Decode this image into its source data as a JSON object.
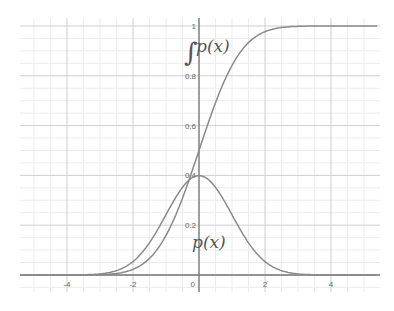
{
  "chart_data": {
    "type": "line",
    "title": "",
    "xlabel": "",
    "ylabel": "",
    "xlim": [
      -5.4,
      5.4
    ],
    "ylim": [
      -0.05,
      1.03
    ],
    "grid": true,
    "x_ticks": [
      "-4",
      "-2",
      "0",
      "2",
      "4"
    ],
    "y_ticks": [
      "0.2",
      "0.4",
      "0.6",
      "0.8",
      "1"
    ],
    "origin_label": "0",
    "annotations": [
      {
        "text": "∫p(x)",
        "x": -0.2,
        "y": 0.9
      },
      {
        "text": "p(x)",
        "x": -0.2,
        "y": 0.12
      }
    ],
    "series": [
      {
        "name": "p(x)",
        "description": "standard normal probability density",
        "x": [
          -4,
          -3,
          -2,
          -1.5,
          -1,
          -0.5,
          0,
          0.5,
          1,
          1.5,
          2,
          3,
          4
        ],
        "values": [
          0.0001,
          0.0044,
          0.054,
          0.1295,
          0.242,
          0.352,
          0.399,
          0.352,
          0.242,
          0.1295,
          0.054,
          0.0044,
          0.0001
        ]
      },
      {
        "name": "∫p(x)",
        "description": "standard normal cumulative distribution",
        "x": [
          -4,
          -3,
          -2,
          -1.5,
          -1,
          -0.5,
          0,
          0.5,
          1,
          1.5,
          2,
          3,
          4
        ],
        "values": [
          3e-05,
          0.0013,
          0.0228,
          0.0668,
          0.1587,
          0.3085,
          0.5,
          0.6915,
          0.8413,
          0.9332,
          0.9772,
          0.9987,
          0.99997
        ]
      }
    ]
  },
  "labels": {
    "cdf": "∫p(x)",
    "pdf": "p(x)"
  },
  "colors": {
    "curve": "#8a8a8a",
    "axis": "#777777",
    "grid_major": "#cfcfcf",
    "grid_minor": "#ececec"
  }
}
